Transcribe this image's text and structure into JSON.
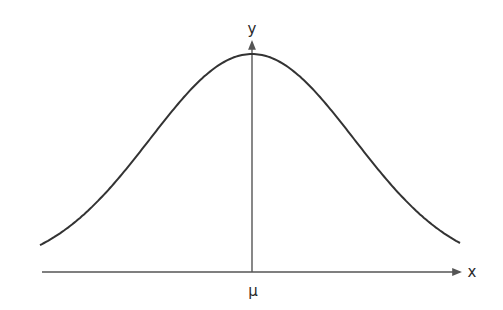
{
  "diagram": {
    "labels": {
      "y_axis": "y",
      "x_axis": "x",
      "mean": "μ"
    },
    "colors": {
      "curve": "#333333",
      "axis": "#555555",
      "background": "#ffffff"
    },
    "curve": {
      "type": "gaussian",
      "peak_px": [
        252,
        57
      ],
      "baseline_px": 272,
      "left_end_px": [
        40,
        269
      ],
      "right_end_px": [
        460,
        269
      ],
      "sigma_px": 102
    }
  }
}
